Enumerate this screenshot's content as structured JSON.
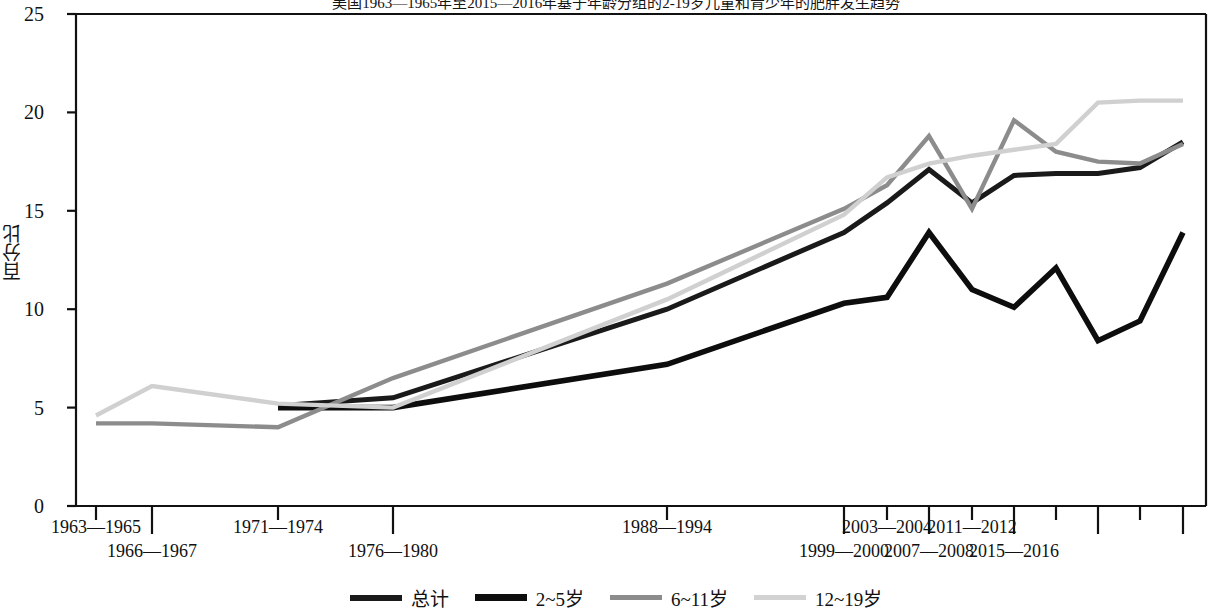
{
  "chart_data": {
    "type": "line",
    "title": "美国1963—1965年至2015—2016年基于年龄分组的2-19岁儿童和青少年的肥胖发生趋势",
    "xlabel": "",
    "ylabel": "百分比",
    "ylim": [
      0,
      25
    ],
    "yticks": [
      0,
      5,
      10,
      15,
      20,
      25
    ],
    "ytick_labels": [
      "0",
      "5",
      "10",
      "15",
      "20",
      "25"
    ],
    "grid": false,
    "legend_position": "bottom",
    "categories": [
      "1963—1965",
      "1966—1967",
      "1971—1974",
      "1976—1980",
      "1988—1994",
      "1999—2000",
      "2001—2002",
      "2003—2004",
      "2005—2006",
      "2007—2008",
      "2009—2010",
      "2011—2012",
      "2013—2014",
      "2015—2016"
    ],
    "xtick_labels_row1": [
      "1963—1965",
      "1971—1974",
      "1988—1994",
      "2003—2004",
      "2011—2012"
    ],
    "xtick_labels_row2": [
      "1966—1967",
      "1976—1980",
      "1999—2000",
      "2007—2008",
      "2015—2016"
    ],
    "series": [
      {
        "name": "总计",
        "color": "#1a1a1a",
        "values": [
          null,
          null,
          5.1,
          5.5,
          10.0,
          13.9,
          15.4,
          17.1,
          15.4,
          16.8,
          16.9,
          16.9,
          17.2,
          18.5
        ]
      },
      {
        "name": "2~5岁",
        "color": "#0d0d0d",
        "values": [
          null,
          null,
          5.0,
          5.0,
          7.2,
          10.3,
          10.6,
          13.9,
          11.0,
          10.1,
          12.1,
          8.4,
          9.4,
          13.9
        ]
      },
      {
        "name": "6~11岁",
        "color": "#8c8c8c",
        "values": [
          4.2,
          4.2,
          4.0,
          6.5,
          11.3,
          15.1,
          16.3,
          18.8,
          15.1,
          19.6,
          18.0,
          17.5,
          17.4,
          18.4
        ]
      },
      {
        "name": "12~19岁",
        "color": "#d0d0d0",
        "values": [
          4.6,
          6.1,
          5.2,
          5.0,
          10.5,
          14.8,
          16.7,
          17.4,
          17.8,
          18.1,
          18.4,
          20.5,
          20.6,
          20.6
        ]
      }
    ],
    "x_positions_px": [
      96,
      152,
      278,
      393,
      667,
      844,
      887,
      929,
      972,
      1014,
      1056,
      1098,
      1140,
      1183
    ]
  },
  "legend": {
    "items": [
      {
        "label": "总计",
        "color": "#1a1a1a",
        "thickness": 6
      },
      {
        "label": "2~5岁",
        "color": "#0d0d0d",
        "thickness": 7
      },
      {
        "label": "6~11岁",
        "color": "#8c8c8c",
        "thickness": 5
      },
      {
        "label": "12~19岁",
        "color": "#d2d2d2",
        "thickness": 5
      }
    ]
  },
  "axes": {
    "plot_left_px": 76,
    "plot_right_px": 1206,
    "plot_top_px": 14,
    "plot_bottom_px": 506
  }
}
